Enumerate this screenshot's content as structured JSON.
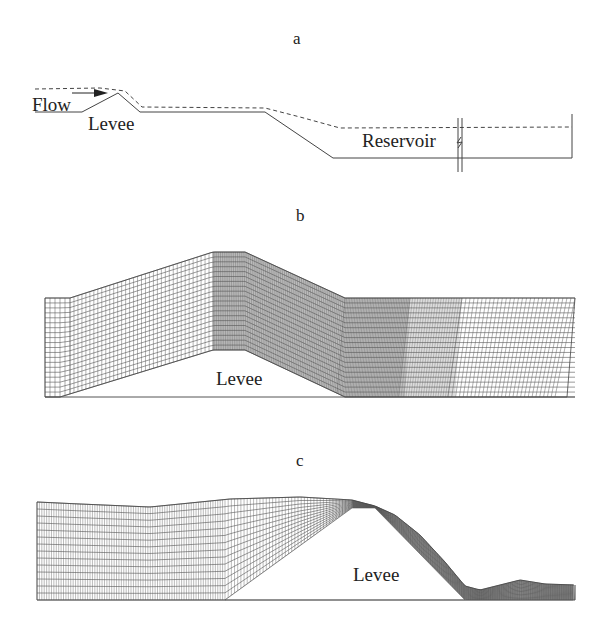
{
  "figure": {
    "panels": [
      {
        "id": "a",
        "letter": "a",
        "description": "Schematic profile: flow over levee into reservoir",
        "labels": {
          "flow": "Flow",
          "levee": "Levee",
          "reservoir": "Reservoir"
        }
      },
      {
        "id": "b",
        "letter": "b",
        "description": "Initial computational mesh over levee",
        "labels": {
          "levee": "Levee"
        }
      },
      {
        "id": "c",
        "letter": "c",
        "description": "Deformed mesh with free surface over levee",
        "labels": {
          "levee": "Levee"
        }
      }
    ],
    "colors": {
      "line": "#333333",
      "mesh": "#555555",
      "dense_mesh_fill": "#8a8a8a",
      "background": "#ffffff"
    }
  }
}
